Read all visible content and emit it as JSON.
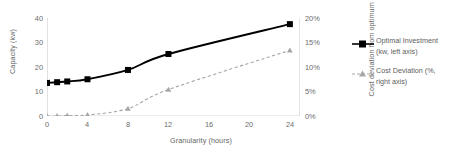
{
  "chart_data": {
    "type": "line",
    "title": "",
    "xlabel": "Granularity (hours)",
    "ylabel": "Capacity (kw)",
    "ylabel_right": "Cost deviation from optimum (%)",
    "x": [
      0,
      1,
      2,
      4,
      8,
      12,
      24
    ],
    "xlim": [
      0,
      25
    ],
    "xticks": [
      0,
      4,
      8,
      12,
      16,
      20,
      24
    ],
    "xtick_labels": [
      "0",
      "4",
      "8",
      "12",
      "16",
      "20",
      "24"
    ],
    "ylim": [
      0,
      40
    ],
    "yticks": [
      0,
      10,
      20,
      30,
      40
    ],
    "ytick_labels": [
      "0",
      "10",
      "20",
      "30",
      "40"
    ],
    "ylim_right": [
      0,
      20
    ],
    "yticks_right": [
      0,
      5,
      10,
      15,
      20
    ],
    "ytick_labels_right": [
      "0%",
      "5%",
      "10%",
      "15%",
      "20%"
    ],
    "grid": false,
    "legend_position": "right",
    "series": [
      {
        "name": "Optimal Investment (kw, left axis)",
        "axis": "left",
        "color": "#000000",
        "marker": "square",
        "linestyle": "solid",
        "values": [
          13.5,
          13.8,
          14.1,
          15.0,
          18.8,
          25.3,
          37.5
        ]
      },
      {
        "name": "Cost Deviation (%, right axis)",
        "axis": "right",
        "color": "#a6a6a6",
        "marker": "triangle",
        "linestyle": "dashed",
        "values": [
          0.0,
          0.0,
          0.1,
          0.2,
          1.5,
          5.4,
          13.4
        ]
      }
    ]
  },
  "legend": {
    "items": [
      {
        "line1": "Optimal Investment",
        "line2": "(kw, left axis)"
      },
      {
        "line1": "Cost Deviation (%,",
        "line2": "right axis)"
      }
    ]
  },
  "colors": {
    "series_primary": "#000000",
    "series_secondary": "#a6a6a6",
    "axis": "#bfbfbf",
    "text": "#666666"
  }
}
